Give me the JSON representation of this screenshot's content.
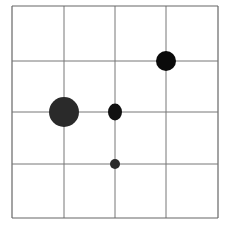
{
  "chart_data": {
    "type": "scatter",
    "title": "",
    "xlabel": "",
    "ylabel": "",
    "grid": true,
    "grid_cells": {
      "cols": 4,
      "rows": 4
    },
    "xlim": [
      0,
      4
    ],
    "ylim": [
      0,
      4
    ],
    "y_origin": "top",
    "points": [
      {
        "col": 1,
        "row": 2,
        "size": "large",
        "rx": 15,
        "ry": 15,
        "color": "#2a2a2a"
      },
      {
        "col": 2,
        "row": 2,
        "size": "medium",
        "rx": 7,
        "ry": 8.5,
        "color": "#111111"
      },
      {
        "col": 3,
        "row": 1,
        "size": "medium-large",
        "rx": 10,
        "ry": 10,
        "color": "#0a0a0a"
      },
      {
        "col": 2,
        "row": 3,
        "size": "small",
        "rx": 5,
        "ry": 5,
        "color": "#2a2a2a"
      }
    ]
  },
  "layout": {
    "x_lines": [
      12,
      64,
      115,
      166,
      218
    ],
    "y_lines": [
      6,
      61,
      112,
      164,
      218
    ],
    "line_color": "#777777",
    "border_color": "#666666"
  }
}
